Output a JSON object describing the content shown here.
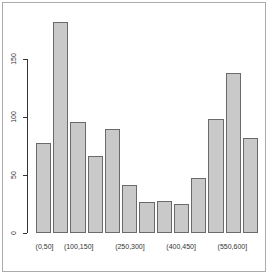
{
  "chart_data": {
    "type": "bar",
    "title": "",
    "xlabel": "",
    "ylabel": "",
    "bar_count": 13,
    "values": [
      78,
      182,
      96,
      66,
      90,
      41,
      27,
      28,
      25,
      47,
      98,
      138,
      82
    ],
    "x_tick_labels": [
      {
        "bar_index": 1,
        "label": "(0,50]"
      },
      {
        "bar_index": 3,
        "label": "(100,150]"
      },
      {
        "bar_index": 6,
        "label": "(250,300]"
      },
      {
        "bar_index": 9,
        "label": "(400,450]"
      },
      {
        "bar_index": 12,
        "label": "(550,600]"
      }
    ],
    "y_ticks": [
      0,
      50,
      100,
      150
    ],
    "ylim": [
      0,
      150
    ],
    "grid": false,
    "legend": "none",
    "colors": {
      "bar_fill": "#c9c9c9",
      "bar_border": "#6a6a6a",
      "axis": "#333333",
      "text": "#333333",
      "background": "#ffffff",
      "frame_border": "#ababab"
    }
  }
}
